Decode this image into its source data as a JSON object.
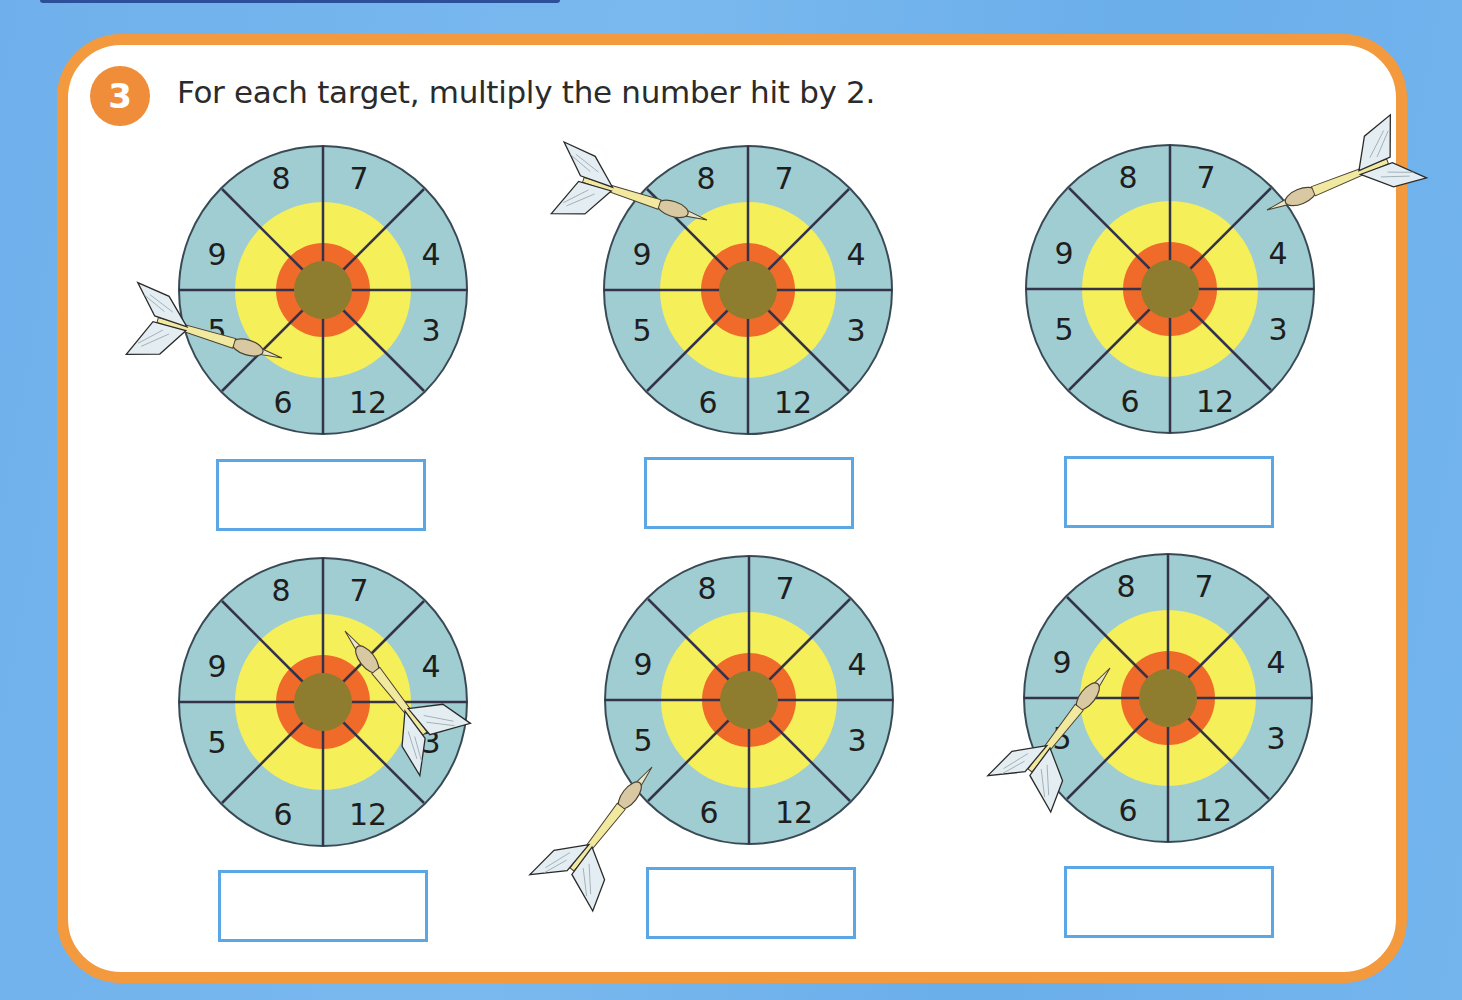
{
  "exercise": {
    "number": "3",
    "instruction": "For each target, multiply the number hit by 2."
  },
  "colors": {
    "background_blue": "#6fb0ec",
    "card_border_orange": "#f39a3e",
    "badge_orange": "#ef8d3b",
    "board_outer": "#9fcdd2",
    "board_yellow": "#f5ef5a",
    "board_orange": "#f06a2a",
    "board_bull": "#8e7d2e",
    "answer_box_border": "#5ba6e4"
  },
  "targets": [
    {
      "id": 1,
      "segments": {
        "top_left": "8",
        "top_right": "7",
        "right_upper": "4",
        "right_lower": "3",
        "bottom_right": "12",
        "bottom_left": "6",
        "left_lower": "5",
        "left_upper": "9"
      },
      "dart_hit": "5",
      "answer": ""
    },
    {
      "id": 2,
      "segments": {
        "top_left": "8",
        "top_right": "7",
        "right_upper": "4",
        "right_lower": "3",
        "bottom_right": "12",
        "bottom_left": "6",
        "left_lower": "5",
        "left_upper": "9"
      },
      "dart_hit": "9",
      "answer": ""
    },
    {
      "id": 3,
      "segments": {
        "top_left": "8",
        "top_right": "7",
        "right_upper": "4",
        "right_lower": "3",
        "bottom_right": "12",
        "bottom_left": "6",
        "left_lower": "5",
        "left_upper": "9"
      },
      "dart_hit": "4",
      "answer": ""
    },
    {
      "id": 4,
      "segments": {
        "top_left": "8",
        "top_right": "7",
        "right_upper": "4",
        "right_lower": "3",
        "bottom_right": "12",
        "bottom_left": "6",
        "left_lower": "5",
        "left_upper": "9"
      },
      "dart_hit": "7",
      "answer": ""
    },
    {
      "id": 5,
      "segments": {
        "top_left": "8",
        "top_right": "7",
        "right_upper": "4",
        "right_lower": "3",
        "bottom_right": "12",
        "bottom_left": "6",
        "left_lower": "5",
        "left_upper": "9"
      },
      "dart_hit": "5",
      "answer": ""
    },
    {
      "id": 6,
      "segments": {
        "top_left": "8",
        "top_right": "7",
        "right_upper": "4",
        "right_lower": "3",
        "bottom_right": "12",
        "bottom_left": "6",
        "left_lower": "5",
        "left_upper": "9"
      },
      "dart_hit": "9",
      "answer": ""
    }
  ]
}
